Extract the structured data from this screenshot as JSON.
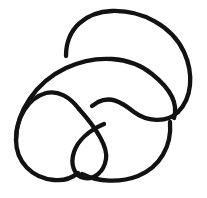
{
  "figure": {
    "kind": "knot-diagram",
    "title": "Knot diagram",
    "background_color": "#ffffff",
    "stroke_color": "#121212",
    "stroke_width": 4.3,
    "canvas": {
      "width": 207,
      "height": 198
    }
  },
  "chart_data": {
    "type": "line",
    "title": "Knot diagram",
    "xlabel": "",
    "ylabel": "",
    "xlim": [
      0,
      207
    ],
    "ylim": [
      0,
      198
    ],
    "grid": false,
    "legend": "none",
    "crossings": [
      {
        "id": "crossing-upper-left",
        "x": 66,
        "y": 56,
        "over": "horizontal-arc",
        "under": "descending-strand"
      },
      {
        "id": "crossing-center",
        "x": 86,
        "y": 110,
        "over": "diagonal-strand",
        "under": "right-arc"
      },
      {
        "id": "crossing-right",
        "x": 165,
        "y": 117,
        "over": "u-curve",
        "under": "vertical-strand"
      },
      {
        "id": "crossing-lower-left",
        "x": 80,
        "y": 171,
        "over": "diagonal-strand",
        "under": "bottom-arc"
      }
    ],
    "series": [
      {
        "name": "top-right-loop",
        "path": "M 66 56 C 66 28 86 12 112 11 C 142 10 172 26 184 52 C 194 74 192 98 178 112"
      },
      {
        "name": "left-circle-and-upper-arc",
        "path": "M 178 112 C 166 124 146 121 134 112 C 120 101 110 96 98 102 L 92 106"
      },
      {
        "name": "outer-left-loop",
        "path": "M 79 109 C 70 97 58 90 46 93 C 28 98 16 118 16 140 C 16 162 32 178 54 180 C 64 181 72 178 78 173"
      },
      {
        "name": "over-arc-upper-left",
        "path": "M 16 140 C 16 112 36 82 66 68 C 96 54 130 56 152 74 C 172 90 178 105 174 118"
      },
      {
        "name": "inner-teardrop",
        "path": "M 79 109 C 96 128 108 146 106 159 C 104 172 94 180 84 178 C 74 176 70 164 74 152 C 78 140 90 130 104 124"
      },
      {
        "name": "bottom-right-arc",
        "path": "M 82 174 C 98 182 120 183 138 176 C 160 167 172 146 170 122"
      }
    ],
    "annotations": []
  }
}
